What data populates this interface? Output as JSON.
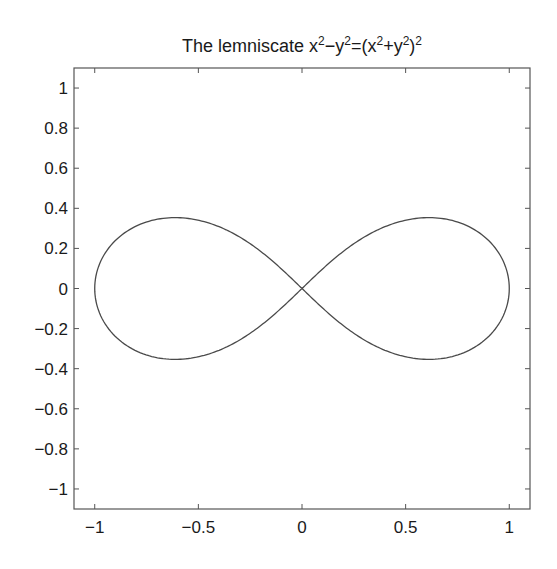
{
  "chart_data": {
    "type": "line",
    "title": {
      "prefix": "The lemniscate x",
      "parts": [
        {
          "text": "The lemniscate x",
          "sup": false
        },
        {
          "text": "2",
          "sup": true
        },
        {
          "text": "−y",
          "sup": false
        },
        {
          "text": "2",
          "sup": true
        },
        {
          "text": "=(x",
          "sup": false
        },
        {
          "text": "2",
          "sup": true
        },
        {
          "text": "+y",
          "sup": false
        },
        {
          "text": "2",
          "sup": true
        },
        {
          "text": ")",
          "sup": false
        },
        {
          "text": "2",
          "sup": true
        }
      ],
      "plain": "The lemniscate x^2-y^2=(x^2+y^2)^2"
    },
    "equation": "x^2 - y^2 = (x^2 + y^2)^2",
    "parametric_form": "r^2 = cos(2*theta)",
    "xlabel": "",
    "ylabel": "",
    "xlim": [
      -1.1,
      1.1
    ],
    "ylim": [
      -1.1,
      1.1
    ],
    "xticks": [
      -1,
      -0.5,
      0,
      0.5,
      1
    ],
    "xtick_labels": [
      "−1",
      "−0.5",
      "0",
      "0.5",
      "1"
    ],
    "yticks": [
      1,
      0.8,
      0.6,
      0.4,
      0.2,
      0,
      -0.2,
      -0.4,
      -0.6,
      -0.8,
      -1
    ],
    "ytick_labels": [
      "1",
      "0.8",
      "0.6",
      "0.4",
      "0.2",
      "0",
      "−0.2",
      "−0.4",
      "−0.6",
      "−0.8",
      "−1"
    ],
    "grid": false,
    "box": true,
    "legend": null,
    "series": [
      {
        "name": "lemniscate",
        "color": "#4a4a4a",
        "key_points": [
          {
            "x": 1,
            "y": 0
          },
          {
            "x": 0.612,
            "y": 0.354
          },
          {
            "x": 0,
            "y": 0
          },
          {
            "x": -0.612,
            "y": 0.354
          },
          {
            "x": -1,
            "y": 0
          },
          {
            "x": -0.612,
            "y": -0.354
          },
          {
            "x": 0.612,
            "y": -0.354
          }
        ],
        "samples": 400
      }
    ]
  },
  "colors": {
    "axis": "#555555",
    "curve": "#4a4a4a",
    "text": "#1a1a1a",
    "background": "#ffffff"
  }
}
